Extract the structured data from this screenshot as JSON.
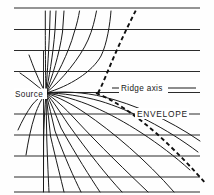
{
  "figure": {
    "background_color": "#fefefe",
    "line_color": "#1a1a1a",
    "width": 214,
    "height": 195
  },
  "labels": {
    "source": "Source",
    "ridge_axis": "Ridge  axis",
    "envelope": "ENVELOPE"
  },
  "chart_data": {
    "type": "line",
    "xlabel": "",
    "ylabel": "",
    "grid": true,
    "legend_position": "none",
    "xlim": [
      0,
      214
    ],
    "ylim": [
      195,
      0
    ],
    "annotations": [
      {
        "text": "Source",
        "x": 22,
        "y": 96,
        "anchor": "start"
      },
      {
        "text": "Ridge  axis",
        "x": 120,
        "y": 90,
        "anchor": "start"
      },
      {
        "text": "ENVELOPE",
        "x": 137,
        "y": 116,
        "anchor": "start"
      }
    ],
    "source_point": {
      "x": 46,
      "y": 93
    },
    "gridlines_y": [
      8,
      29.5,
      50.5,
      71.5,
      92.5,
      114,
      135,
      156,
      177,
      192
    ],
    "gridline_x_range": [
      14,
      200
    ],
    "vertical_axis": {
      "x": 43.5,
      "y_top": 50.5,
      "y_bottom": 192
    },
    "ridge_axis_leaders": [
      {
        "x1": 112,
        "y1": 88,
        "x2": 122,
        "y2": 88
      },
      {
        "x1": 166,
        "y1": 88,
        "x2": 196,
        "y2": 88
      }
    ],
    "series": [
      {
        "name": "ray-up-1",
        "path": "M46,93 C45.6,80 45.4,60 45.3,30 L45.3,11"
      },
      {
        "name": "ray-up-2",
        "path": "M46,93 C46.6,80 48.5,58 49.6,30 L50.2,11"
      },
      {
        "name": "ray-up-3",
        "path": "M46,93 C48.5,80 53.0,56 55.0,30 L56.0,11"
      },
      {
        "name": "ray-up-4",
        "path": "M46,93 C51.5,79 59.5,54 62.5,32 L64.0,11"
      },
      {
        "name": "ray-up-5",
        "path": "M46,93 C56,78 69,52 74,33 C77,24 78.5,17 79.5,11"
      },
      {
        "name": "ray-up-6",
        "path": "M46,93 C62,80 80,58 88,40 C92.5,30 95,19 96.5,11"
      },
      {
        "name": "ray-up-7",
        "path": "M46,93 C70,86 92,72 101,56 C107,44 110,24 111,11"
      },
      {
        "name": "ray-down-1",
        "path": "M46,93 C62,91 84,92 104,97 C133,104 168,119 200,141"
      },
      {
        "name": "ray-down-2",
        "path": "M46,93 C62,93 82,96 100,101 C130,110 166,128 198,152"
      },
      {
        "name": "ray-down-3",
        "path": "M46,93 C60,95 78,100 94,107 C124,120 160,143 190,170"
      },
      {
        "name": "ray-down-4",
        "path": "M46,93 C58,97 72,104 85,113 C113,132 146,160 174,192"
      },
      {
        "name": "ray-down-5",
        "path": "M46,93 C55,99 65,108 75,119 C100,146 127,172 148,192"
      },
      {
        "name": "ray-down-6",
        "path": "M46,93 C53,101 60,112 68,124 C88,152 107,176 122,192"
      },
      {
        "name": "ray-down-7",
        "path": "M46,93 C51,103 56,115 61,128 C76,155 90,177 100,192"
      },
      {
        "name": "ray-down-8",
        "path": "M46,93 C49,105 52,118 55,131 C65,158 74,178 81,192"
      },
      {
        "name": "ray-down-9",
        "path": "M46,93 C47.5,107 49,122 50.5,136 C56,160 61,179 64,192"
      },
      {
        "name": "ray-down-10",
        "path": "M46,93 C46.2,108 46.5,124 46.8,140 C47.6,162 48.4,180 49,192"
      },
      {
        "name": "ray-down-11",
        "path": "M46,93 C44.8,108 43.8,126 43.6,142 L43.5,192"
      },
      {
        "name": "ray-left-1",
        "path": "M46,93 C42,98 38,106 35,115 C31,127 28,142 26,155"
      },
      {
        "name": "ray-left-2",
        "path": "M46,93 C41,96 36,100 32,105 C27,112 22,121 18,130"
      },
      {
        "name": "ray-left-3",
        "path": "M46,93 C40,93 34,93 28,93 L20,93"
      },
      {
        "name": "ray-left-4",
        "path": "M46,93 C41,89 36,85 31,81 C27,78 23,75 20,73"
      },
      {
        "name": "ray-left-5",
        "path": "M46,93 C42,87 39,80 36,73 C33,66 31,60 29,55"
      }
    ],
    "envelope_curves": [
      {
        "name": "upper-dashed-caustic",
        "path": "M98,93 C103,84 108,70 116,52 C123,36 131,20 136,10"
      },
      {
        "name": "lower-dashed-caustic",
        "path": "M96,93 C112,99 134,114 156,133 C176,151 194,170 206,184"
      }
    ]
  }
}
